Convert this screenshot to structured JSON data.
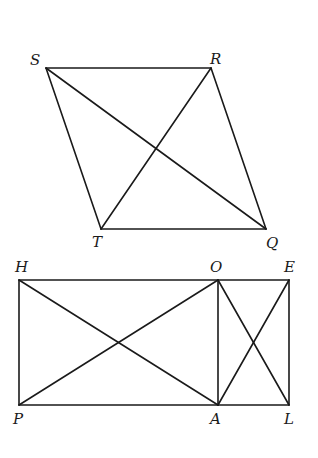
{
  "figures": [
    {
      "name": "parallelogram-SRQT",
      "vertices": {
        "S": {
          "label": "S",
          "x": 46,
          "y": 68
        },
        "R": {
          "label": "R",
          "x": 211,
          "y": 68
        },
        "Q": {
          "label": "Q",
          "x": 266,
          "y": 229
        },
        "T": {
          "label": "T",
          "x": 101,
          "y": 229
        }
      },
      "segments": [
        "SR",
        "RQ",
        "QT",
        "TS",
        "SQ",
        "RT"
      ]
    },
    {
      "name": "rectangle-HELP",
      "vertices": {
        "H": {
          "label": "H",
          "x": 19,
          "y": 280
        },
        "O": {
          "label": "O",
          "x": 218,
          "y": 280
        },
        "E": {
          "label": "E",
          "x": 289,
          "y": 280
        },
        "P": {
          "label": "P",
          "x": 19,
          "y": 405
        },
        "A": {
          "label": "A",
          "x": 218,
          "y": 405
        },
        "L": {
          "label": "L",
          "x": 289,
          "y": 405
        }
      },
      "segments": [
        "HE",
        "EL",
        "LP",
        "PH",
        "OA",
        "HA",
        "PO",
        "OL",
        "AE"
      ]
    }
  ],
  "labels": {
    "S": "S",
    "R": "R",
    "T": "T",
    "Q": "Q",
    "H": "H",
    "O": "O",
    "E": "E",
    "P": "P",
    "A": "A",
    "L": "L"
  }
}
